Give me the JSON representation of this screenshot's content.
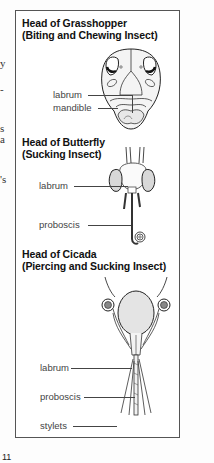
{
  "margin_fragments": [
    {
      "text": "y",
      "top": 57
    },
    {
      "text": "-",
      "top": 83
    },
    {
      "text": "s",
      "top": 122
    },
    {
      "text": "a",
      "top": 133
    },
    {
      "text": "'s",
      "top": 173
    }
  ],
  "figure": {
    "sections": [
      {
        "title": "Head of Grasshopper",
        "subtitle": "(Biting and Chewing Insect)",
        "labels": [
          "labrum",
          "mandible"
        ]
      },
      {
        "title": "Head of Butterfly",
        "subtitle": "(Sucking Insect)",
        "labels": [
          "labrum",
          "proboscis"
        ]
      },
      {
        "title": "Head of Cicada",
        "subtitle": "(Piercing and Sucking Insect)",
        "labels": [
          "labrum",
          "proboscis",
          "stylets"
        ]
      }
    ]
  },
  "page_number": "11",
  "colors": {
    "border": "#555555",
    "text": "#111111",
    "label": "#444444"
  }
}
